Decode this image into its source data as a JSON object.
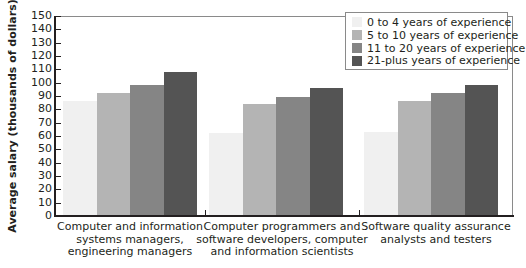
{
  "chart_data": {
    "type": "bar",
    "title": "",
    "xlabel": "",
    "ylabel": "Average salary (thousands of dollars)",
    "ylim": [
      0,
      150
    ],
    "yticks": [
      0,
      10,
      20,
      30,
      40,
      50,
      60,
      70,
      80,
      90,
      100,
      110,
      120,
      130,
      140,
      150
    ],
    "grid": false,
    "legend_position": "top-right",
    "categories": [
      "Computer and information systems managers, engineering managers",
      "Computer programmers and software developers, computer and information scientists",
      "Software quality assurance analysts and testers"
    ],
    "category_lines": [
      [
        "Computer and information",
        "systems managers,",
        "engineering managers"
      ],
      [
        "Computer programmers and",
        "software developers, computer",
        "and information scientists"
      ],
      [
        "Software quality assurance",
        "analysts and testers"
      ]
    ],
    "series": [
      {
        "name": "0 to 4 years of experience",
        "color": "#f0f0f0",
        "values": [
          86,
          62,
          63
        ]
      },
      {
        "name": "5 to 10 years of experience",
        "color": "#b4b4b4",
        "values": [
          92,
          84,
          86
        ]
      },
      {
        "name": "11 to 20 years of experience",
        "color": "#858585",
        "values": [
          98,
          89,
          92
        ]
      },
      {
        "name": "21-plus years of experience",
        "color": "#545454",
        "values": [
          108,
          96,
          98
        ]
      }
    ]
  }
}
